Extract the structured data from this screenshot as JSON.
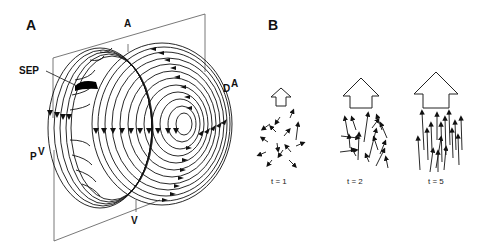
{
  "panelA": {
    "label": "A",
    "labels": {
      "top_axis": "A",
      "bottom_axis": "V",
      "sep": "SEP",
      "right_base": "D",
      "right_sup": "A",
      "left_base": "P",
      "left_sup": "V"
    }
  },
  "panelB": {
    "label": "B",
    "groups": [
      {
        "time_label": "t = 1",
        "arrow_size": "small",
        "alignment": "random"
      },
      {
        "time_label": "t = 2",
        "arrow_size": "medium",
        "alignment": "partial"
      },
      {
        "time_label": "t = 5",
        "arrow_size": "large",
        "alignment": "aligned"
      }
    ]
  },
  "colors": {
    "ink": "#111111",
    "frame": "#555555",
    "background": "#ffffff"
  }
}
